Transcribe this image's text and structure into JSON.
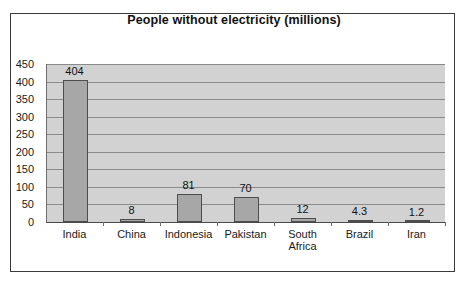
{
  "chart_data": {
    "type": "bar",
    "title": "People without electricity (millions)",
    "xlabel": "",
    "ylabel": "",
    "categories": [
      "India",
      "China",
      "Indonesia",
      "Pakistan",
      "South\nAfrica",
      "Brazil",
      "Iran"
    ],
    "values": [
      404,
      8,
      81,
      70,
      12,
      4.3,
      1.2
    ],
    "value_labels": [
      "404",
      "8",
      "81",
      "70",
      "12",
      "4.3",
      "1.2"
    ],
    "ylim": [
      0,
      450
    ],
    "ytick_labels": [
      "450",
      "400",
      "350",
      "300",
      "250",
      "200",
      "150",
      "100",
      "50",
      "0"
    ],
    "ytick_values": [
      450,
      400,
      350,
      300,
      250,
      200,
      150,
      100,
      50,
      0
    ],
    "grid": true,
    "legend": false,
    "colors": {
      "bar_fill": "#a7a7a7",
      "bar_border": "#4d4d4d",
      "plot_background": "#d2d2d2",
      "gridline": "#8b8b8b",
      "frame_border": "#3a3a3a",
      "text": "#111111"
    }
  }
}
